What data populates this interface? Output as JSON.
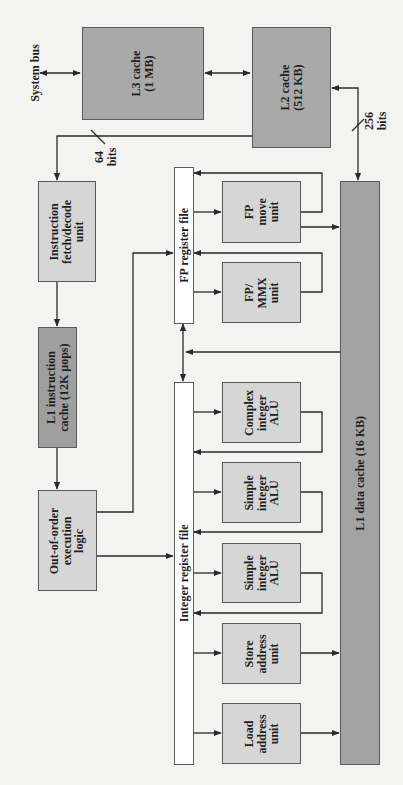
{
  "diagram": {
    "system_bus": "System bus",
    "l3_cache": "L3 cache\n(1 MB)",
    "l2_cache": "L2 cache\n(512 KB)",
    "bits_64": "64\nbits",
    "bits_256": "256\nbits",
    "instruction_fetch": "Instruction\nfetch/decode\nunit",
    "l1_instruction_cache": "L1 instruction\ncache (12K µops)",
    "out_of_order": "Out-of-order\nexecution\nlogic",
    "fp_register_file": "FP register file",
    "integer_register_file": "Integer register file",
    "fp_move_unit": "FP\nmove\nunit",
    "fp_mmx_unit": "FP/\nMMX\nunit",
    "complex_integer_alu": "Complex\ninteger\nALU",
    "simple_integer_alu_1": "Simple\ninteger\nALU",
    "simple_integer_alu_2": "Simple\ninteger\nALU",
    "store_address_unit": "Store\naddress\nunit",
    "load_address_unit": "Load\naddress\nunit",
    "l1_data_cache": "L1 data cache (16 KB)"
  }
}
